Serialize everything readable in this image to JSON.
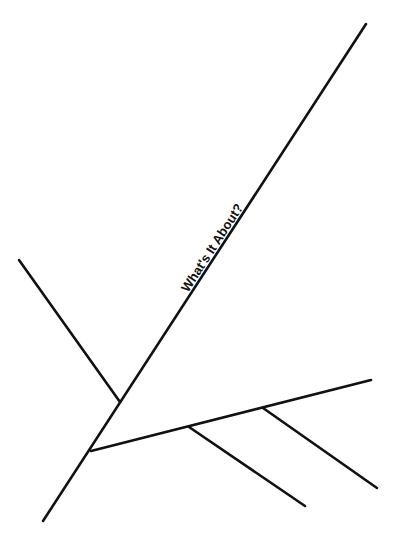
{
  "diagram": {
    "type": "fishbone-fragment",
    "colors": {
      "line": "#111111",
      "background": "#ffffff"
    },
    "main_line": {
      "label": "What's It About?",
      "from": [
        43,
        521
      ],
      "to": [
        366,
        24
      ]
    },
    "branches": [
      {
        "name": "upper-left-branch",
        "from": [
          19,
          260
        ],
        "to": [
          120,
          402
        ]
      },
      {
        "name": "lower-right-branch",
        "from": [
          91,
          451
        ],
        "to": [
          371,
          380
        ]
      }
    ],
    "sub_branches": [
      {
        "name": "sub-branch-1",
        "from": [
          189,
          427
        ],
        "to": [
          305,
          506
        ]
      },
      {
        "name": "sub-branch-2",
        "from": [
          263,
          408
        ],
        "to": [
          377,
          488
        ]
      }
    ]
  }
}
